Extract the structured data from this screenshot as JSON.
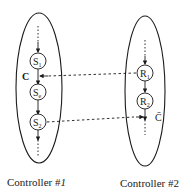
{
  "diagram": {
    "controllers": [
      {
        "label": "Controller #1",
        "label_prefix": "Controller #",
        "label_number": "1",
        "states": [
          {
            "name": "S",
            "sub": "1"
          },
          {
            "name": "S",
            "sub": "e"
          },
          {
            "name": "S",
            "sub": "2"
          }
        ],
        "condition_label": "C"
      },
      {
        "label": "Controller #2",
        "label_prefix": "Controller #",
        "label_number": "2",
        "states": [
          {
            "name": "R",
            "sub": "1"
          },
          {
            "name": "R",
            "sub": "2"
          }
        ],
        "condition_label": "C̄"
      }
    ],
    "links": [
      {
        "from": "R1",
        "to": "between S1 and Se",
        "style": "dashed",
        "label": "C"
      },
      {
        "from": "S2",
        "to": "below R2",
        "style": "dashed",
        "label": "C̄"
      }
    ],
    "colors": {
      "stroke": "#1a1a1a",
      "background": "#ffffff"
    }
  }
}
